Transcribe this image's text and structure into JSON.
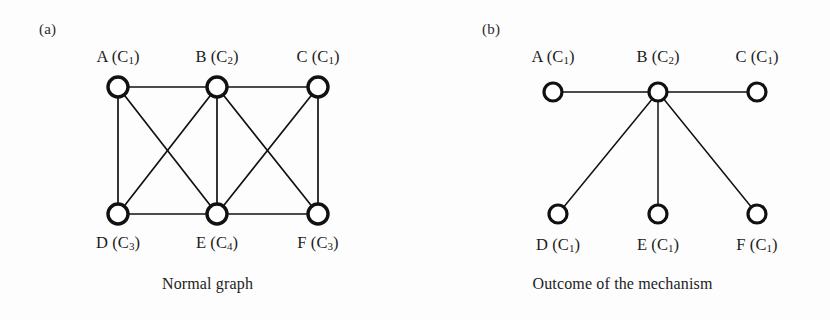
{
  "figure": {
    "width": 830,
    "height": 320,
    "background_color": "#fdfdfd",
    "ink_color": "#111111"
  },
  "chart_data": {
    "type": "diagram",
    "diagram_kind": "node-link-graph",
    "title": "",
    "panels": [
      {
        "id": "a",
        "panel_label": "(a)",
        "caption": "Normal graph",
        "node_radius": 10,
        "node_stroke_width": 3.4,
        "edge_stroke_width": 1.7,
        "nodes": [
          {
            "id": "A",
            "label": "A (C",
            "subscript": "1",
            "label_suffix": ")",
            "full_label": "A (C1)",
            "x": 118,
            "y": 87,
            "label_x": 118,
            "label_y": 47,
            "label_position": "above"
          },
          {
            "id": "B",
            "label": "B (C",
            "subscript": "2",
            "label_suffix": ")",
            "full_label": "B (C2)",
            "x": 217,
            "y": 87,
            "label_x": 217,
            "label_y": 47,
            "label_position": "above"
          },
          {
            "id": "C",
            "label": "C (C",
            "subscript": "1",
            "label_suffix": ")",
            "full_label": "C (C1)",
            "x": 318,
            "y": 87,
            "label_x": 318,
            "label_y": 47,
            "label_position": "above"
          },
          {
            "id": "D",
            "label": "D (C",
            "subscript": "3",
            "label_suffix": ")",
            "full_label": "D (C3)",
            "x": 118,
            "y": 214,
            "label_x": 118,
            "label_y": 233,
            "label_position": "below"
          },
          {
            "id": "E",
            "label": "E (C",
            "subscript": "4",
            "label_suffix": ")",
            "full_label": "E (C4)",
            "x": 217,
            "y": 214,
            "label_x": 217,
            "label_y": 233,
            "label_position": "below"
          },
          {
            "id": "F",
            "label": "F (C",
            "subscript": "3",
            "label_suffix": ")",
            "full_label": "F (C3)",
            "x": 318,
            "y": 214,
            "label_x": 318,
            "label_y": 233,
            "label_position": "below"
          }
        ],
        "edges": [
          {
            "from": "A",
            "to": "B"
          },
          {
            "from": "B",
            "to": "C"
          },
          {
            "from": "A",
            "to": "D"
          },
          {
            "from": "A",
            "to": "E"
          },
          {
            "from": "B",
            "to": "D"
          },
          {
            "from": "B",
            "to": "E"
          },
          {
            "from": "B",
            "to": "F"
          },
          {
            "from": "C",
            "to": "E"
          },
          {
            "from": "C",
            "to": "F"
          },
          {
            "from": "D",
            "to": "E"
          },
          {
            "from": "E",
            "to": "F"
          }
        ]
      },
      {
        "id": "b",
        "panel_label": "(b)",
        "caption": "Outcome of the mechanism",
        "node_radius": 9,
        "node_stroke_width": 3.2,
        "edge_stroke_width": 1.5,
        "nodes": [
          {
            "id": "A",
            "label": "A (C",
            "subscript": "1",
            "label_suffix": ")",
            "full_label": "A (C1)",
            "x": 138,
            "y": 92,
            "label_x": 138,
            "label_y": 47,
            "label_position": "above"
          },
          {
            "id": "B",
            "label": "B (C",
            "subscript": "2",
            "label_suffix": ")",
            "full_label": "B (C2)",
            "x": 243,
            "y": 92,
            "label_x": 243,
            "label_y": 47,
            "label_position": "above"
          },
          {
            "id": "C",
            "label": "C (C",
            "subscript": "1",
            "label_suffix": ")",
            "full_label": "C (C1)",
            "x": 342,
            "y": 92,
            "label_x": 342,
            "label_y": 47,
            "label_position": "above"
          },
          {
            "id": "D",
            "label": "D (C",
            "subscript": "1",
            "label_suffix": ")",
            "full_label": "D (C1)",
            "x": 143,
            "y": 214,
            "label_x": 143,
            "label_y": 235,
            "label_position": "below"
          },
          {
            "id": "E",
            "label": "E (C",
            "subscript": "1",
            "label_suffix": ")",
            "full_label": "E (C1)",
            "x": 243,
            "y": 214,
            "label_x": 243,
            "label_y": 235,
            "label_position": "below"
          },
          {
            "id": "F",
            "label": "F (C",
            "subscript": "1",
            "label_suffix": ")",
            "full_label": "F (C1)",
            "x": 342,
            "y": 214,
            "label_x": 342,
            "label_y": 235,
            "label_position": "below"
          }
        ],
        "edges": [
          {
            "from": "A",
            "to": "B"
          },
          {
            "from": "B",
            "to": "C"
          },
          {
            "from": "B",
            "to": "D"
          },
          {
            "from": "B",
            "to": "E"
          },
          {
            "from": "B",
            "to": "F"
          }
        ]
      }
    ]
  }
}
